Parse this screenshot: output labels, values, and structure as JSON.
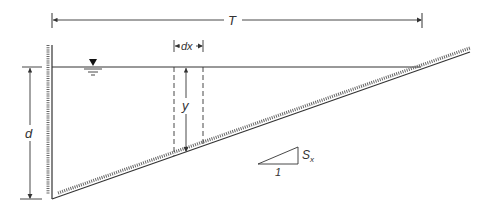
{
  "diagram": {
    "labels": {
      "top_width": "T",
      "depth": "d",
      "local_depth": "y",
      "strip_width": "dx",
      "slope_run": "1",
      "slope_rise_base": "S",
      "slope_rise_sub": "x"
    },
    "icons": {
      "water_surface_marker": "inverted-triangle-water-level"
    },
    "colors": {
      "line": "#333333",
      "hatch": "#555555",
      "background": "#ffffff"
    }
  }
}
